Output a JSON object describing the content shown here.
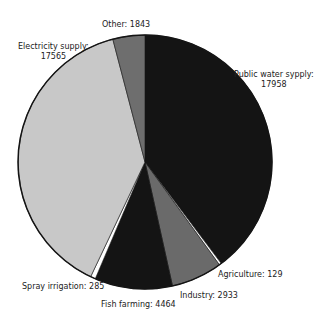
{
  "chart_data": {
    "type": "pie",
    "title": "",
    "start_angle_deg": 0,
    "direction": "clockwise",
    "total": 45177,
    "slices": [
      {
        "label": "Public water sypply",
        "value": 17958,
        "color": "#141414"
      },
      {
        "label": "Agriculture",
        "value": 129,
        "color": "#ffffff"
      },
      {
        "label": "Industry",
        "value": 2933,
        "color": "#6a6a6a"
      },
      {
        "label": "Fish farming",
        "value": 4464,
        "color": "#141414"
      },
      {
        "label": "Spray irrigation",
        "value": 285,
        "color": "#ffffff"
      },
      {
        "label": "Electricity supply",
        "value": 17565,
        "color": "#c8c8c8"
      },
      {
        "label": "Other",
        "value": 1843,
        "color": "#6e6e6e"
      }
    ],
    "legend": "none (direct labels)"
  },
  "labels": {
    "public_water_line1": "Public water sypply:",
    "public_water_line2": "17958",
    "agriculture": "Agriculture: 129",
    "industry": "Industry: 2933",
    "fish_farming": "Fish farming: 4464",
    "spray_irrigation": "Spray irrigation: 285",
    "electricity_line1": "Electricity supply:",
    "electricity_line2": "17565",
    "other": "Other: 1843"
  },
  "geometry": {
    "cx": 145,
    "cy": 162,
    "r": 127
  }
}
